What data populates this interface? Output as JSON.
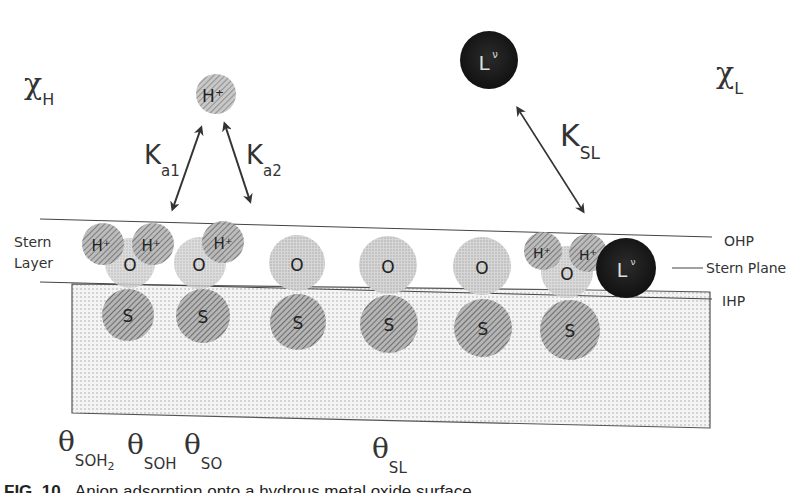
{
  "labels": {
    "chi_h": {
      "symbol": "χ",
      "sub": "H"
    },
    "chi_l": {
      "symbol": "χ",
      "sub": "L"
    },
    "k_a1": {
      "symbol": "K",
      "sub": "a1"
    },
    "k_a2": {
      "symbol": "K",
      "sub": "a2"
    },
    "k_sl": {
      "symbol": "K",
      "sub": "SL"
    },
    "stern_layer_line1": "Stern",
    "stern_layer_line2": "Layer",
    "ohp": "OHP",
    "stern_plane": "Stern Plane",
    "ihp": "IHP"
  },
  "free_species": {
    "proton": "H⁺",
    "ligand": "L",
    "ligand_charge": "ν"
  },
  "surface_sites": [
    {
      "surface": "S",
      "oxygen": "O",
      "protons": [
        "H⁺",
        "H⁺"
      ],
      "ligand": null
    },
    {
      "surface": "S",
      "oxygen": "O",
      "protons": [
        "H⁺"
      ],
      "ligand": null
    },
    {
      "surface": "S",
      "oxygen": "O",
      "protons": [],
      "ligand": null
    },
    {
      "surface": "S",
      "oxygen": "O",
      "protons": [],
      "ligand": null
    },
    {
      "surface": "S",
      "oxygen": "O",
      "protons": [],
      "ligand": null
    },
    {
      "surface": "S",
      "oxygen": "O",
      "protons": [
        "H⁺",
        "H⁺"
      ],
      "ligand": "L"
    }
  ],
  "coverage_labels": [
    {
      "symbol": "θ",
      "sub": "SOH",
      "sub2": "2"
    },
    {
      "symbol": "θ",
      "sub": "SOH",
      "sub2": ""
    },
    {
      "symbol": "θ",
      "sub": "SO",
      "sub2": ""
    },
    {
      "symbol": "θ",
      "sub": "SL",
      "sub2": ""
    }
  ],
  "caption": {
    "label": "FIG. 10",
    "text": "Anion adsorption onto a hydrous metal oxide surface"
  },
  "colors": {
    "surface_fill": "#e9e9e9",
    "hatched_sphere": "#8f8f8f",
    "light_sphere": "#c9c9c9",
    "ligand_sphere": "#1a1a1a",
    "line": "#444444"
  }
}
